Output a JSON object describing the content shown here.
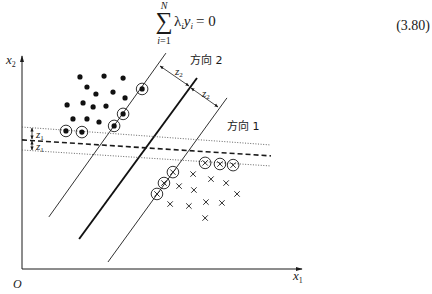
{
  "equation": {
    "sum_symbol": "∑",
    "upper_limit": "N",
    "lower_var": "i",
    "lower_rest": "=1",
    "lambda": "λ",
    "lambda_sub": "i",
    "y": "y",
    "y_sub": "i",
    "rhs": "= 0",
    "number": "(3.80)"
  },
  "labels": {
    "x1_var": "x",
    "x1_sub": "1",
    "x2_var": "x",
    "x2_sub": "2",
    "origin": "O",
    "direction_1": "方向 1",
    "direction_2": "方向 2",
    "z1_var": "z",
    "z1_sub": "1",
    "z2_var": "z",
    "z2_sub": "2"
  },
  "chart_data": {
    "type": "scatter",
    "title": "",
    "xlabel": "x1",
    "ylabel": "x2",
    "origin_label": "O",
    "xlim": [
      0,
      100
    ],
    "ylim": [
      0,
      76
    ],
    "grid": false,
    "legend": "none",
    "series": [
      {
        "name": "positive",
        "marker": "filled-dot",
        "points": [
          [
            20.7,
            68.6
          ],
          [
            29.3,
            68.9
          ],
          [
            36.1,
            68.2
          ],
          [
            23.2,
            65.0
          ],
          [
            26.4,
            62.5
          ],
          [
            32.5,
            63.2
          ],
          [
            36.8,
            61.1
          ],
          [
            16.1,
            58.6
          ],
          [
            21.8,
            59.3
          ],
          [
            25.4,
            57.9
          ],
          [
            30.0,
            58.2
          ],
          [
            18.2,
            53.6
          ],
          [
            23.2,
            53.6
          ],
          [
            27.5,
            52.5
          ]
        ]
      },
      {
        "name": "positive-support-vectors",
        "marker": "circled-dot",
        "points": [
          [
            42.9,
            64.3
          ],
          [
            36.1,
            55.4
          ],
          [
            32.9,
            51.1
          ],
          [
            15.7,
            49.3
          ],
          [
            21.4,
            48.9
          ]
        ]
      },
      {
        "name": "negative",
        "marker": "cross",
        "points": [
          [
            61.1,
            33.9
          ],
          [
            67.5,
            32.1
          ],
          [
            72.9,
            30.7
          ],
          [
            56.1,
            29.6
          ],
          [
            61.4,
            28.2
          ],
          [
            76.8,
            26.8
          ],
          [
            52.9,
            23.2
          ],
          [
            59.6,
            22.5
          ],
          [
            65.7,
            23.9
          ],
          [
            71.4,
            23.6
          ],
          [
            65.4,
            18.2
          ]
        ]
      },
      {
        "name": "negative-support-vectors",
        "marker": "circled-cross",
        "points": [
          [
            65.4,
            37.9
          ],
          [
            70.7,
            37.5
          ],
          [
            75.4,
            37.1
          ],
          [
            53.9,
            34.6
          ],
          [
            50.7,
            30.7
          ],
          [
            48.2,
            26.8
          ]
        ]
      }
    ],
    "lines": [
      {
        "name": "direction-2-margin-left",
        "style": "solid",
        "points": [
          [
            51.4,
            77.1
          ],
          [
            9.6,
            18.6
          ]
        ]
      },
      {
        "name": "direction-2-separator",
        "style": "bold",
        "points": [
          [
            62.5,
            68.2
          ],
          [
            20.4,
            10.7
          ]
        ]
      },
      {
        "name": "direction-2-margin-right",
        "style": "solid",
        "points": [
          [
            73.2,
            61.1
          ],
          [
            30.7,
            2.5
          ]
        ]
      },
      {
        "name": "direction-1-margin-top",
        "style": "dotted",
        "points": [
          [
            0,
            50.7
          ],
          [
            88.9,
            44.3
          ]
        ]
      },
      {
        "name": "direction-1-separator",
        "style": "dashed",
        "points": [
          [
            0,
            46.1
          ],
          [
            88.9,
            40.4
          ]
        ]
      },
      {
        "name": "direction-1-margin-bottom",
        "style": "dotted",
        "points": [
          [
            0,
            42.5
          ],
          [
            88.9,
            36.8
          ]
        ]
      }
    ],
    "annotations": [
      "方向 1",
      "方向 2",
      "z1",
      "z1",
      "z2",
      "z2"
    ]
  }
}
